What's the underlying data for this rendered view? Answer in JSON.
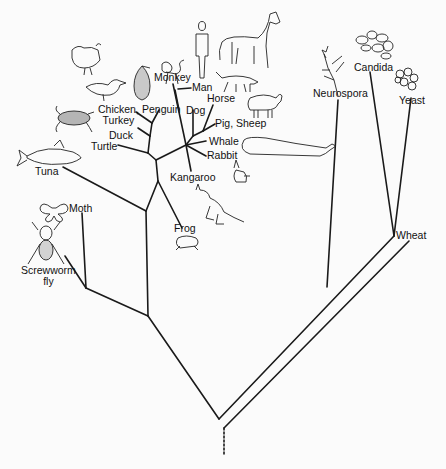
{
  "diagram": {
    "type": "phylogenetic-tree",
    "title": "",
    "colors": {
      "background": "#fbfbfb",
      "line": "#1a1a1a",
      "text": "#111111"
    },
    "taxa": {
      "chicken_turkey": [
        "Chicken,",
        "Turkey"
      ],
      "penguin": "Penguin",
      "duck": "Duck",
      "turtle": "Turtle",
      "tuna": "Tuna",
      "monkey": "Monkey",
      "man": "Man",
      "horse": "Horse",
      "dog": "Dog",
      "pig_sheep": "Pig, Sheep",
      "whale": "Whale",
      "rabbit": "Rabbit",
      "kangaroo": "Kangaroo",
      "frog": "Frog",
      "moth": "Moth",
      "screwworm": [
        "Screwworm",
        "fly"
      ],
      "neurospora": "Neurospora",
      "candida": "Candida",
      "yeast": "Yeast",
      "wheat": "Wheat"
    },
    "illustrations": [
      "chicken",
      "duck",
      "penguin",
      "turtle",
      "tuna",
      "monkey",
      "man",
      "horse",
      "dog",
      "sheep",
      "whale",
      "rabbit",
      "kangaroo",
      "frog",
      "moth",
      "screwworm-fly",
      "neurospora",
      "candida",
      "yeast"
    ],
    "root_style": "dashed"
  }
}
